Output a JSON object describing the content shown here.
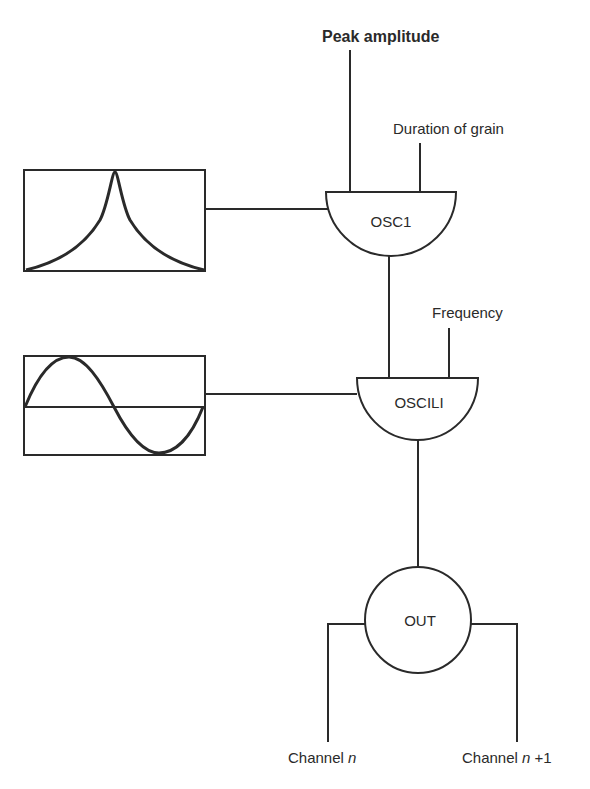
{
  "diagram": {
    "inputs": {
      "peak_amplitude": "Peak amplitude",
      "duration_of_grain": "Duration of grain",
      "frequency": "Frequency"
    },
    "nodes": {
      "osc1": "OSC1",
      "oscili": "OSCILI",
      "out": "OUT"
    },
    "function_tables": [
      {
        "name": "envelope-table",
        "shape": "gaussian"
      },
      {
        "name": "waveform-table",
        "shape": "sine"
      }
    ],
    "outputs": {
      "channel_left_prefix": "Channel ",
      "channel_left_var": "n",
      "channel_right_prefix": "Channel ",
      "channel_right_var": "n",
      "channel_right_suffix": " +1"
    },
    "colors": {
      "ink": "#2a2a2a",
      "background": "#ffffff"
    }
  }
}
